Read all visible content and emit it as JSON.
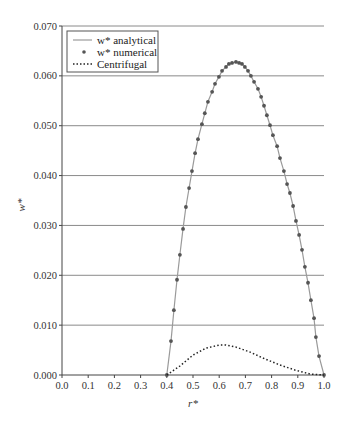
{
  "chart_data": {
    "type": "line",
    "title": "",
    "xlabel": "r*",
    "ylabel": "w*",
    "xlim": [
      0.0,
      1.0
    ],
    "ylim": [
      0.0,
      0.07
    ],
    "grid": {
      "horizontal": true,
      "vertical": false
    },
    "legend_position": "upper-left",
    "x_ticks": [
      "0.0",
      "0.1",
      "0.2",
      "0.3",
      "0.4",
      "0.5",
      "0.6",
      "0.7",
      "0.8",
      "0.9",
      "1.0"
    ],
    "y_ticks": [
      "0.000",
      "0.010",
      "0.020",
      "0.030",
      "0.040",
      "0.050",
      "0.060",
      "0.070"
    ],
    "series": [
      {
        "name": "w* analytical",
        "style": "solid line",
        "color": "#9a9a9a",
        "points": [
          [
            0.4,
            0.0
          ],
          [
            0.416,
            0.0068
          ],
          [
            0.427,
            0.013
          ],
          [
            0.439,
            0.0191
          ],
          [
            0.45,
            0.0241
          ],
          [
            0.462,
            0.0293
          ],
          [
            0.473,
            0.0337
          ],
          [
            0.485,
            0.0375
          ],
          [
            0.496,
            0.0409
          ],
          [
            0.508,
            0.0445
          ],
          [
            0.519,
            0.0473
          ],
          [
            0.534,
            0.0503
          ],
          [
            0.545,
            0.0525
          ],
          [
            0.557,
            0.0548
          ],
          [
            0.573,
            0.0568
          ],
          [
            0.584,
            0.0584
          ],
          [
            0.599,
            0.0598
          ],
          [
            0.611,
            0.061
          ],
          [
            0.626,
            0.0618
          ],
          [
            0.637,
            0.0624
          ],
          [
            0.649,
            0.0626
          ],
          [
            0.664,
            0.0628
          ],
          [
            0.676,
            0.0626
          ],
          [
            0.687,
            0.0624
          ],
          [
            0.698,
            0.0618
          ],
          [
            0.71,
            0.061
          ],
          [
            0.721,
            0.06
          ],
          [
            0.733,
            0.0588
          ],
          [
            0.748,
            0.0574
          ],
          [
            0.76,
            0.0558
          ],
          [
            0.771,
            0.054
          ],
          [
            0.782,
            0.0521
          ],
          [
            0.794,
            0.0501
          ],
          [
            0.805,
            0.0481
          ],
          [
            0.821,
            0.0459
          ],
          [
            0.832,
            0.0435
          ],
          [
            0.847,
            0.0409
          ],
          [
            0.859,
            0.0383
          ],
          [
            0.87,
            0.0365
          ],
          [
            0.882,
            0.0339
          ],
          [
            0.893,
            0.0309
          ],
          [
            0.905,
            0.0281
          ],
          [
            0.916,
            0.0251
          ],
          [
            0.927,
            0.0217
          ],
          [
            0.939,
            0.0185
          ],
          [
            0.95,
            0.015
          ],
          [
            0.962,
            0.0114
          ],
          [
            0.969,
            0.0076
          ],
          [
            0.981,
            0.0038
          ],
          [
            1.0,
            0.0
          ]
        ]
      },
      {
        "name": "w* numerical",
        "style": "markers",
        "color": "#555555",
        "points": [
          [
            0.4,
            0.0
          ],
          [
            0.416,
            0.0068
          ],
          [
            0.427,
            0.013
          ],
          [
            0.439,
            0.0191
          ],
          [
            0.45,
            0.0241
          ],
          [
            0.462,
            0.0293
          ],
          [
            0.473,
            0.0337
          ],
          [
            0.485,
            0.0375
          ],
          [
            0.496,
            0.0409
          ],
          [
            0.508,
            0.0445
          ],
          [
            0.519,
            0.0473
          ],
          [
            0.534,
            0.0503
          ],
          [
            0.545,
            0.0525
          ],
          [
            0.557,
            0.0548
          ],
          [
            0.573,
            0.0568
          ],
          [
            0.584,
            0.0584
          ],
          [
            0.599,
            0.0598
          ],
          [
            0.611,
            0.061
          ],
          [
            0.626,
            0.0618
          ],
          [
            0.637,
            0.0624
          ],
          [
            0.649,
            0.0626
          ],
          [
            0.664,
            0.0628
          ],
          [
            0.676,
            0.0626
          ],
          [
            0.687,
            0.0624
          ],
          [
            0.698,
            0.0618
          ],
          [
            0.71,
            0.061
          ],
          [
            0.721,
            0.06
          ],
          [
            0.733,
            0.0588
          ],
          [
            0.748,
            0.0574
          ],
          [
            0.76,
            0.0558
          ],
          [
            0.771,
            0.054
          ],
          [
            0.782,
            0.0521
          ],
          [
            0.794,
            0.0501
          ],
          [
            0.805,
            0.0481
          ],
          [
            0.821,
            0.0459
          ],
          [
            0.832,
            0.0435
          ],
          [
            0.847,
            0.0409
          ],
          [
            0.859,
            0.0383
          ],
          [
            0.87,
            0.0365
          ],
          [
            0.882,
            0.0339
          ],
          [
            0.893,
            0.0309
          ],
          [
            0.905,
            0.0281
          ],
          [
            0.916,
            0.0251
          ],
          [
            0.927,
            0.0217
          ],
          [
            0.939,
            0.0185
          ],
          [
            0.95,
            0.015
          ],
          [
            0.962,
            0.0114
          ],
          [
            0.969,
            0.0076
          ],
          [
            0.981,
            0.0038
          ],
          [
            1.0,
            0.0
          ]
        ]
      },
      {
        "name": "Centrifugal",
        "style": "dotted line",
        "color": "#222222",
        "points": [
          [
            0.4,
            0.0
          ],
          [
            0.45,
            0.0018
          ],
          [
            0.5,
            0.004
          ],
          [
            0.55,
            0.0054
          ],
          [
            0.6,
            0.006
          ],
          [
            0.626,
            0.006
          ],
          [
            0.664,
            0.0056
          ],
          [
            0.718,
            0.0046
          ],
          [
            0.775,
            0.0032
          ],
          [
            0.832,
            0.002
          ],
          [
            0.889,
            0.001
          ],
          [
            0.947,
            0.0002
          ],
          [
            1.0,
            0.0
          ]
        ]
      }
    ]
  },
  "legend": {
    "items": [
      {
        "label": "w* analytical",
        "symbol": "line"
      },
      {
        "label": "w* numerical",
        "symbol": "dot"
      },
      {
        "label": "Centrifugal",
        "symbol": "dotted"
      }
    ]
  }
}
